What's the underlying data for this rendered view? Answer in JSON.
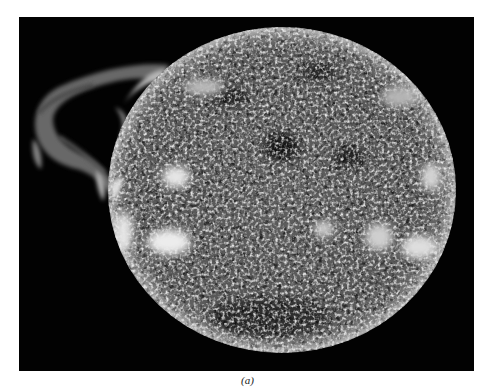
{
  "figure": {
    "caption": "(a)",
    "background_color": "#020202",
    "page_color": "#ffffff",
    "disk": {
      "center_x": 263,
      "center_y": 173,
      "radius_x": 174,
      "radius_y": 163,
      "base_color": "#5a5a5a",
      "highlight_color": "#e8e8e8"
    },
    "prominence": {
      "position": "left-limb",
      "color": "#bdbdbd"
    },
    "bright_regions": [
      {
        "name": "plage-left-upper",
        "cx": 157,
        "cy": 160,
        "rx": 14,
        "ry": 11
      },
      {
        "name": "plage-left-lower",
        "cx": 150,
        "cy": 225,
        "rx": 22,
        "ry": 13
      },
      {
        "name": "plage-left-limb",
        "cx": 105,
        "cy": 215,
        "rx": 9,
        "ry": 20
      },
      {
        "name": "plage-right-center",
        "cx": 360,
        "cy": 220,
        "rx": 14,
        "ry": 14
      },
      {
        "name": "plage-right-lower",
        "cx": 400,
        "cy": 230,
        "rx": 18,
        "ry": 12
      },
      {
        "name": "plage-right-limb",
        "cx": 412,
        "cy": 160,
        "rx": 10,
        "ry": 14
      },
      {
        "name": "plage-center",
        "cx": 305,
        "cy": 212,
        "rx": 10,
        "ry": 8
      }
    ],
    "dark_regions": [
      {
        "name": "dark-filament-1",
        "cx": 262,
        "cy": 130,
        "rx": 18,
        "ry": 14
      },
      {
        "name": "dark-filament-2",
        "cx": 330,
        "cy": 140,
        "rx": 16,
        "ry": 10
      },
      {
        "name": "dark-filament-3",
        "cx": 210,
        "cy": 80,
        "rx": 20,
        "ry": 9
      },
      {
        "name": "dark-filament-4",
        "cx": 300,
        "cy": 55,
        "rx": 18,
        "ry": 8
      }
    ]
  }
}
